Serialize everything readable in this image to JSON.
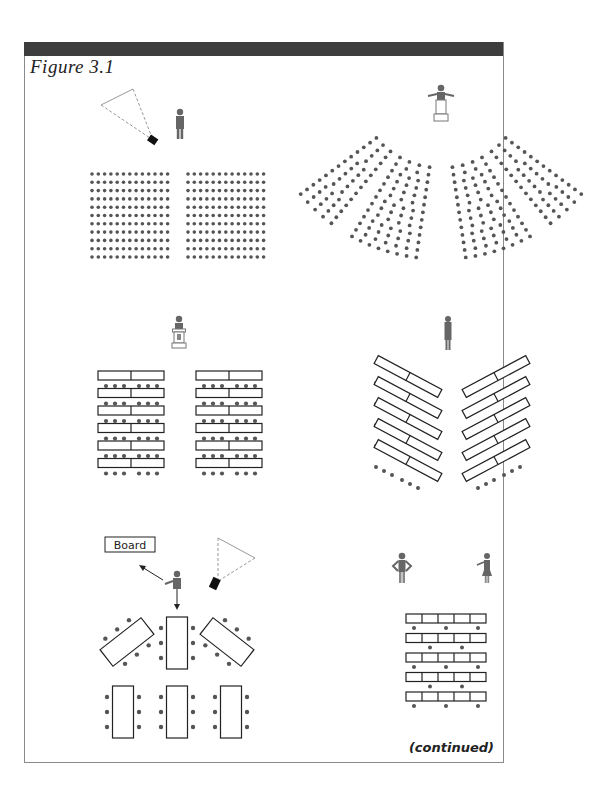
{
  "figure": {
    "title": "Figure 3.1",
    "continued_label": "(continued)",
    "colors": {
      "header_bar": "#3d3d3d",
      "border": "#8a8a8a",
      "seat_dot": "#555555",
      "person": "#666666",
      "table_stroke": "#222222"
    }
  },
  "panels": [
    {
      "id": "theater-style",
      "description": "Speaker with projector; two blocks of seats, 13 columns x 11 rows each",
      "blocks": 2,
      "columns_per_block": 13,
      "rows": 11
    },
    {
      "id": "auditorium-chevron",
      "description": "Speaker at lectern; curved fan-shaped seating in four sections"
    },
    {
      "id": "classroom-style",
      "description": "Speaker at lectern; two columns of 6 rows of two-part tables with 6 seats each"
    },
    {
      "id": "chevron-classroom",
      "description": "Standing speaker; angled tables in two chevron columns of 5 rows"
    },
    {
      "id": "conference-clusters",
      "board_label": "Board",
      "description": "Speaker pointing to board with projector; 6 rectangular tables with seats"
    },
    {
      "id": "herringbone-bench",
      "description": "Two standing presenters; 5 rows of 5-segment tables with staggered seats"
    }
  ]
}
